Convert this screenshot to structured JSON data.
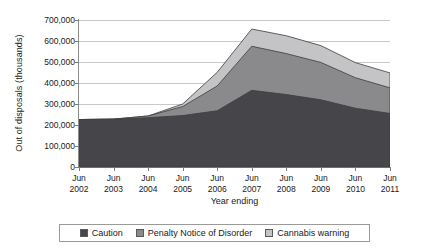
{
  "chart_data": {
    "type": "area",
    "stacked": true,
    "title": "",
    "xlabel": "Year ending",
    "ylabel": "Out of disposals (thousands)",
    "categories": [
      "Jun 2002",
      "Jun 2003",
      "Jun 2004",
      "Jun 2005",
      "Jun 2006",
      "Jun 2007",
      "Jun 2008",
      "Jun 2009",
      "Jun 2010",
      "Jun 2011"
    ],
    "xtick_lines": [
      {
        "top": "Jun",
        "bottom": "2002"
      },
      {
        "top": "Jun",
        "bottom": "2003"
      },
      {
        "top": "Jun",
        "bottom": "2004"
      },
      {
        "top": "Jun",
        "bottom": "2005"
      },
      {
        "top": "Jun",
        "bottom": "2006"
      },
      {
        "top": "Jun",
        "bottom": "2007"
      },
      {
        "top": "Jun",
        "bottom": "2008"
      },
      {
        "top": "Jun",
        "bottom": "2009"
      },
      {
        "top": "Jun",
        "bottom": "2010"
      },
      {
        "top": "Jun",
        "bottom": "2011"
      }
    ],
    "ylim": [
      0,
      700000
    ],
    "yticks": [
      0,
      100000,
      200000,
      300000,
      400000,
      500000,
      600000,
      700000
    ],
    "ytick_labels": [
      "0",
      "100,000",
      "200,000",
      "300,000",
      "400,000",
      "500,000",
      "600,000",
      "700,000"
    ],
    "grid": true,
    "legend_position": "bottom",
    "series": [
      {
        "name": "Caution",
        "color": "#46464a",
        "values": [
          226000,
          228000,
          235000,
          245000,
          268000,
          365000,
          345000,
          320000,
          280000,
          255000
        ]
      },
      {
        "name": "Penalty Notice of Disorder",
        "color": "#8a8a8d",
        "values": [
          0,
          0,
          8000,
          43000,
          118000,
          210000,
          195000,
          178000,
          145000,
          122000
        ]
      },
      {
        "name": "Cannabis warning",
        "color": "#c4c4c6",
        "values": [
          0,
          0,
          0,
          12000,
          65000,
          82000,
          85000,
          80000,
          72000,
          71000
        ]
      }
    ],
    "totals": [
      226000,
      228000,
      243000,
      300000,
      451000,
      657000,
      625000,
      578000,
      497000,
      448000
    ]
  }
}
